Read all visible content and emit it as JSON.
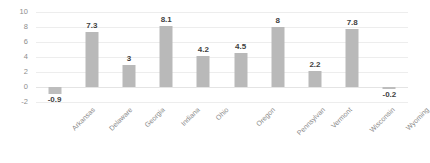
{
  "chart_data": {
    "type": "bar",
    "title": "",
    "subtitle": "",
    "xlabel": "",
    "ylabel": "",
    "ylim": [
      -2,
      10
    ],
    "yticks": [
      "10",
      "8",
      "6",
      "4",
      "2",
      "0",
      "-2"
    ],
    "ytick_values": [
      10,
      8,
      6,
      4,
      2,
      0,
      -2
    ],
    "grid": true,
    "legend": false,
    "legend_position": "none",
    "bar_color": "#b9b9b9",
    "categories": [
      "Arkansas",
      "Delaware",
      "Georgia",
      "Indiana",
      "Ohio",
      "Oregon",
      "Pennsylvan",
      "Vermont",
      "Wisconsin",
      "Wyoming"
    ],
    "values": [
      -0.9,
      7.3,
      3,
      8.1,
      4.2,
      4.5,
      8,
      2.2,
      7.8,
      -0.2
    ],
    "data_labels": [
      "-0.9",
      "7.3",
      "3",
      "8.1",
      "4.2",
      "4.5",
      "8",
      "2.2",
      "7.8",
      "-0.2"
    ]
  }
}
